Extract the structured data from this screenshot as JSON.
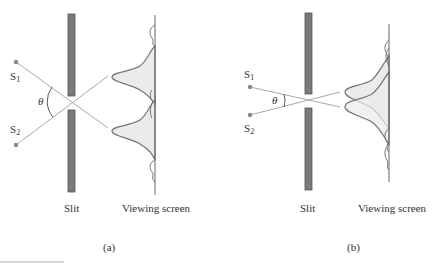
{
  "figure": {
    "panels": [
      {
        "id": "a",
        "caption": "(a)",
        "slit_label": "Slit",
        "screen_label": "Viewing screen",
        "source1_label": "S",
        "source1_sub": "1",
        "source2_label": "S",
        "source2_sub": "2",
        "angle_label": "θ",
        "description": "Two sources with large angular separation; diffraction patterns on viewing screen are well resolved"
      },
      {
        "id": "b",
        "caption": "(b)",
        "slit_label": "Slit",
        "screen_label": "Viewing screen",
        "source1_label": "S",
        "source1_sub": "1",
        "source2_label": "S",
        "source2_sub": "2",
        "angle_label": "θ",
        "description": "Two sources with small angular separation; diffraction patterns overlap and are not resolved"
      }
    ]
  },
  "colors": {
    "slit_fill": "#7a7a7a",
    "slit_outline": "#555555",
    "ray": "#aaaaaa",
    "curve": "#777777",
    "pattern_fill": "#ebebeb",
    "source_dot": "#888888",
    "screen_line": "#666666"
  }
}
